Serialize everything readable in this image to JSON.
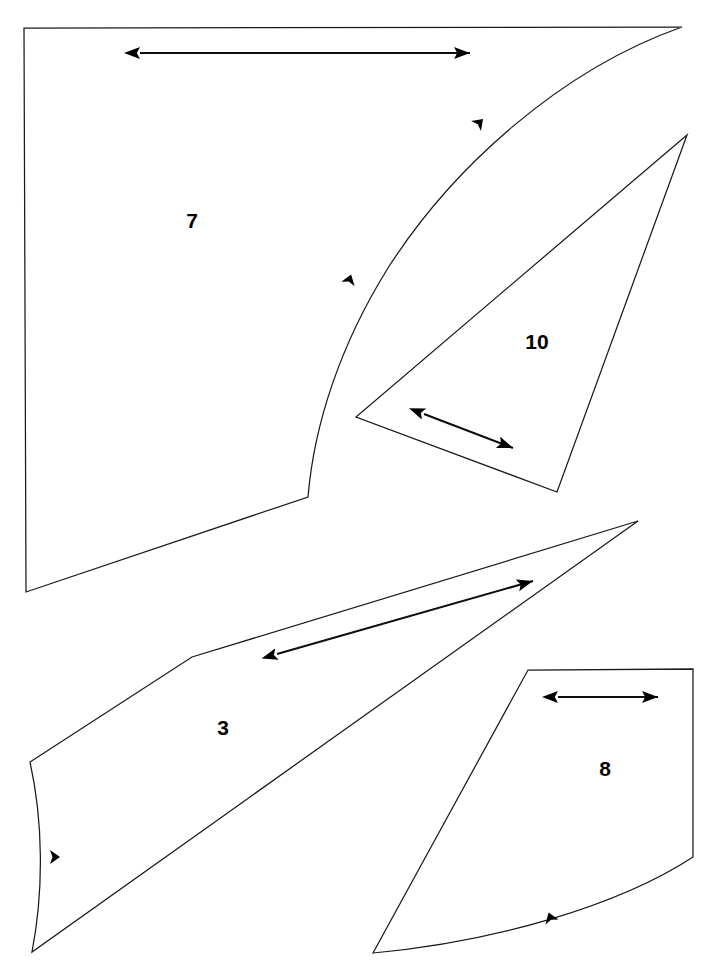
{
  "document": {
    "title": "Sewing Pattern Piece Layout Sheet",
    "background_color": "#ffffff",
    "line_color": "#1a1a1a",
    "marker_color": "#000000",
    "width": 722,
    "height": 977
  },
  "pieces": [
    {
      "id": "piece-7",
      "label": "7",
      "label_x": 192,
      "label_y": 222,
      "outline": "M 24,28 L 682,27 C 560,70 452,168 388,268 C 340,345 314,425 308,497 L 26,592 L 24,28 Z",
      "grain_arrow": {
        "name": "grain-arrow-7",
        "x1": 140,
        "y1": 53,
        "x2": 470,
        "y2": 53,
        "double_headed": true
      },
      "notches": [
        {
          "name": "notch-7-upper",
          "x": 476,
          "y": 126,
          "angle": -45
        },
        {
          "name": "notch-7-lower",
          "x": 348,
          "y": 284,
          "angle": -72
        }
      ]
    },
    {
      "id": "piece-10",
      "label": "10",
      "label_x": 537,
      "label_y": 343,
      "outline": "M 687,135 L 356,417 L 557,492 Z",
      "grain_arrow": {
        "name": "grain-arrow-10",
        "x1": 424,
        "y1": 414,
        "x2": 513,
        "y2": 448,
        "double_headed": true
      },
      "notches": []
    },
    {
      "id": "piece-3",
      "label": "3",
      "label_x": 223,
      "label_y": 729,
      "outline": "M 638,521 L 192,657 L 30,762 C 43,820 44,890 32,952 L 638,521 Z",
      "grain_arrow": {
        "name": "grain-arrow-3",
        "x1": 277,
        "y1": 654,
        "x2": 533,
        "y2": 581,
        "double_headed": true
      },
      "notches": [
        {
          "name": "notch-3-left",
          "x": 50,
          "y": 857,
          "angle": 0
        }
      ]
    },
    {
      "id": "piece-8",
      "label": "8",
      "label_x": 605,
      "label_y": 770,
      "outline": "M 528,670 L 693,669 L 693,857 C 620,905 495,942 373,953 L 528,670 Z",
      "grain_arrow": {
        "name": "grain-arrow-8",
        "x1": 558,
        "y1": 697,
        "x2": 658,
        "y2": 697,
        "double_headed": true
      },
      "notches": [
        {
          "name": "notch-8-bottom",
          "x": 552,
          "y": 922,
          "angle": -110
        }
      ]
    }
  ]
}
